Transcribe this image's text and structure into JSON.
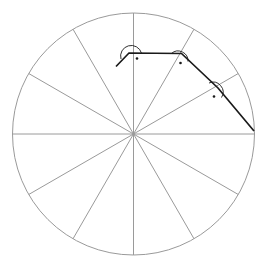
{
  "figure": {
    "background_color": "#ffffff",
    "width": 257,
    "height": 268
  },
  "colors": {
    "circle_stroke": "#9a9a9a",
    "spoke_stroke": "#9a9a9a",
    "spiral_stroke": "#1a1a1a",
    "angle_marker_stroke": "#1a1a1a",
    "angle_marker_dot": "#1a1a1a",
    "background": "#ffffff"
  },
  "geometry": {
    "center": {
      "x": 133.5,
      "y": 134.0
    },
    "radius": 121.0,
    "circle_stroke_width": 1.0,
    "spoke_stroke_width": 1.0,
    "spiral_stroke_width": 1.7,
    "sector_count": 12,
    "sector_angle_degrees": 30
  },
  "spokes": {
    "count": 12,
    "angles_degrees": [
      0,
      30,
      60,
      90,
      120,
      150,
      180,
      210,
      240,
      270,
      300,
      330
    ]
  },
  "spiral": {
    "description": "Chain of segments meeting at right angles, each vertex lying on a radial spoke",
    "stroke_width": 1.7,
    "points": [
      {
        "x": 116.0,
        "y": 66.5,
        "label": "tail-start",
        "on_spoke_degrees": null
      },
      {
        "x": 129.0,
        "y": 53.0,
        "label": "vertex-1",
        "on_spoke_degrees": 90
      },
      {
        "x": 181.5,
        "y": 53.5,
        "label": "vertex-2",
        "on_spoke_degrees": 60
      },
      {
        "x": 218.0,
        "y": 88.0,
        "label": "vertex-3",
        "on_spoke_degrees": 30
      },
      {
        "x": 254.0,
        "y": 131.0,
        "label": "endpoint-on-circle",
        "on_spoke_degrees": 0
      }
    ]
  },
  "angle_markers": [
    {
      "name": "right-angle-vertex-1",
      "vertex": {
        "x": 129.0,
        "y": 53.0
      },
      "arc_radius": 10.0,
      "dot_radius": 1.3,
      "dot": {
        "x": 137.0,
        "y": 58.5
      },
      "arc_start": {
        "x": 121.0,
        "y": 59.0
      },
      "arc_end": {
        "x": 141.5,
        "y": 53.2
      },
      "value_degrees": 90
    },
    {
      "name": "right-angle-vertex-2",
      "vertex": {
        "x": 181.5,
        "y": 53.5
      },
      "arc_radius": 10.0,
      "dot_radius": 1.3,
      "dot": {
        "x": 180.5,
        "y": 63.0
      },
      "arc_start": {
        "x": 171.5,
        "y": 53.4
      },
      "arc_end": {
        "x": 188.0,
        "y": 61.5
      },
      "value_degrees": 90
    },
    {
      "name": "right-angle-vertex-3",
      "vertex": {
        "x": 218.0,
        "y": 88.0
      },
      "arc_radius": 10.0,
      "dot_radius": 1.3,
      "dot": {
        "x": 214.0,
        "y": 96.5
      },
      "arc_start": {
        "x": 209.0,
        "y": 83.0
      },
      "arc_end": {
        "x": 221.5,
        "y": 97.5
      },
      "value_degrees": 90
    }
  ],
  "labels": {
    "has_text_labels": false,
    "text_items": []
  }
}
